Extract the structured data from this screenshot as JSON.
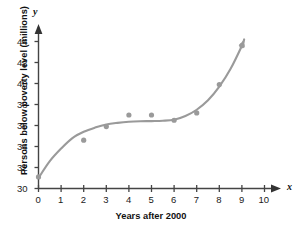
{
  "chart_data": {
    "type": "scatter",
    "title": "",
    "xlabel": "Years after 2000",
    "ylabel": "Persons below poverty level (millions)",
    "x_axis_letter": "x",
    "y_axis_letter": "y",
    "xlim": [
      0,
      10
    ],
    "ylim": [
      30,
      44
    ],
    "xticks": [
      "0",
      "1",
      "2",
      "3",
      "4",
      "5",
      "6",
      "7",
      "8",
      "9",
      "10"
    ],
    "yticks": [
      "30",
      "32",
      "34",
      "36",
      "38",
      "40",
      "42",
      "44"
    ],
    "grid": false,
    "legend": null,
    "x": [
      0,
      2,
      3,
      4,
      5,
      6,
      7,
      8,
      9
    ],
    "values": [
      31.1,
      34.6,
      35.9,
      37.0,
      37.0,
      36.5,
      37.2,
      39.9,
      43.6
    ],
    "series": [
      {
        "name": "Persons below poverty level",
        "x": [
          0,
          2,
          3,
          4,
          5,
          6,
          7,
          8,
          9
        ],
        "values": [
          31.1,
          34.6,
          35.9,
          37.0,
          37.0,
          36.5,
          37.2,
          39.9,
          43.6
        ]
      }
    ],
    "fit_curve": {
      "name": "model curve",
      "x": [
        0,
        0.5,
        1,
        1.5,
        2,
        2.5,
        3,
        3.5,
        4,
        4.5,
        5,
        5.5,
        6,
        6.5,
        7,
        7.5,
        8,
        8.5,
        9,
        9.1
      ],
      "values": [
        31.0,
        32.6,
        33.8,
        34.8,
        35.4,
        35.8,
        36.1,
        36.25,
        36.35,
        36.4,
        36.42,
        36.45,
        36.55,
        36.9,
        37.5,
        38.4,
        39.7,
        41.4,
        43.6,
        44.2
      ]
    },
    "colors": {
      "curve": "#9a9a9a",
      "points": "#9a9a9a",
      "axis": "#444444",
      "text": "#111111",
      "background": "#ffffff"
    }
  }
}
